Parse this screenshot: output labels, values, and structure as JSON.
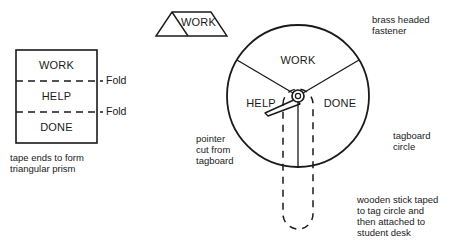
{
  "figure": {
    "stroke_color": "#1a1a1a",
    "text_color": "#1a1a1a",
    "background": "#ffffff"
  },
  "flat_panel": {
    "name": "folded tagboard strip",
    "segments": [
      {
        "label": "WORK"
      },
      {
        "label": "HELP"
      },
      {
        "label": "DONE"
      }
    ],
    "fold_labels": [
      "Fold",
      "Fold"
    ],
    "caption_lines": [
      "tape ends to form",
      "triangular prism"
    ]
  },
  "prism": {
    "name": "triangular prism",
    "label": "WORK"
  },
  "wheel": {
    "name": "tagboard circle spinner",
    "sectors": [
      {
        "label": "WORK"
      },
      {
        "label": "HELP"
      },
      {
        "label": "DONE"
      }
    ],
    "hub": "brass headed fastener",
    "pointer": "pointer arrow"
  },
  "annotations": {
    "fastener": [
      "brass headed",
      "fastener"
    ],
    "pointer": [
      "pointer",
      "cut from",
      "tagboard"
    ],
    "tagboard_circle": [
      "tagboard",
      "circle"
    ],
    "stick": [
      "wooden stick taped",
      "to tag circle and",
      "then attached to",
      "student desk"
    ]
  }
}
